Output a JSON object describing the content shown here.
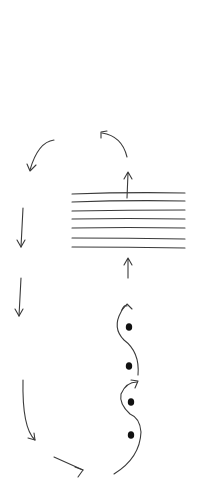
{
  "diagram": {
    "colors": {
      "background": "#ffffff",
      "stroke": "#3a3a3a",
      "dot": "#111111"
    },
    "layers": {
      "count": 7,
      "x_start": 72,
      "x_end": 185,
      "y_positions": [
        193,
        201,
        210,
        218,
        227,
        237,
        247
      ]
    },
    "particles": [
      {
        "x": 129,
        "y": 327
      },
      {
        "x": 129,
        "y": 366
      },
      {
        "x": 131,
        "y": 402
      },
      {
        "x": 131,
        "y": 435
      }
    ],
    "arrows": [
      {
        "name": "arrow-up-into-layers",
        "direction": "up"
      },
      {
        "name": "arrow-up-out-of-layers",
        "direction": "up"
      },
      {
        "name": "arrow-curve-top-right",
        "direction": "up-left"
      },
      {
        "name": "arrow-curve-top-left",
        "direction": "down-left"
      },
      {
        "name": "arrow-down-left-1",
        "direction": "down"
      },
      {
        "name": "arrow-down-left-2",
        "direction": "down"
      },
      {
        "name": "arrow-curve-bottom-left",
        "direction": "down-right"
      },
      {
        "name": "arrow-bottom-right",
        "direction": "right"
      },
      {
        "name": "wavy-path-upper",
        "direction": "up"
      },
      {
        "name": "wavy-path-lower",
        "direction": "up"
      }
    ]
  }
}
